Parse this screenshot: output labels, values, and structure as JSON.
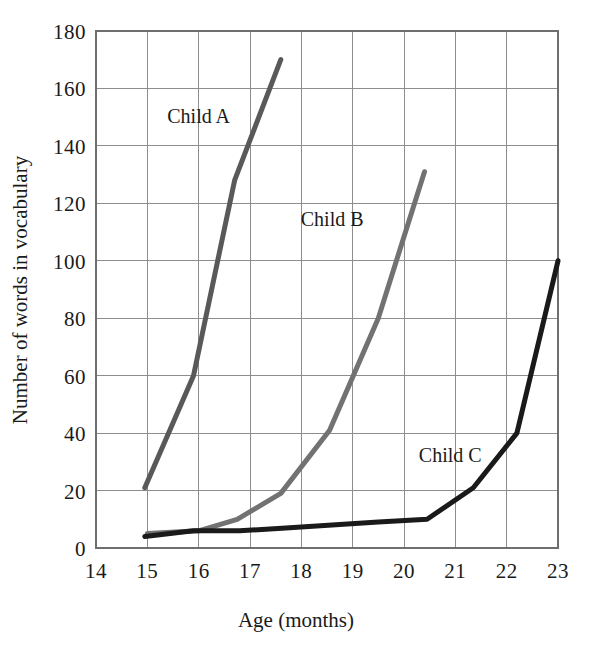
{
  "chart_data": {
    "type": "line",
    "title": "",
    "xlabel": "Age (months)",
    "ylabel": "Number of words in vocabulary",
    "xlim": [
      14,
      23
    ],
    "ylim": [
      0,
      180
    ],
    "x_ticks": [
      14,
      15,
      16,
      17,
      18,
      19,
      20,
      21,
      22,
      23
    ],
    "y_ticks": [
      0,
      20,
      40,
      60,
      80,
      100,
      120,
      140,
      160,
      180
    ],
    "grid": true,
    "legend_position": "inline-annotations",
    "series": [
      {
        "name": "Child A",
        "color": "#595959",
        "label_x": 16.0,
        "label_y": 148,
        "points": [
          {
            "x": 14.95,
            "y": 21
          },
          {
            "x": 15.9,
            "y": 60
          },
          {
            "x": 16.7,
            "y": 128
          },
          {
            "x": 17.6,
            "y": 170
          }
        ]
      },
      {
        "name": "Child B",
        "color": "#727272",
        "label_x": 18.6,
        "label_y": 112,
        "points": [
          {
            "x": 15.0,
            "y": 5
          },
          {
            "x": 16.0,
            "y": 6
          },
          {
            "x": 16.75,
            "y": 10
          },
          {
            "x": 17.6,
            "y": 19
          },
          {
            "x": 18.55,
            "y": 41
          },
          {
            "x": 19.5,
            "y": 80
          },
          {
            "x": 20.4,
            "y": 131
          }
        ]
      },
      {
        "name": "Child C",
        "color": "#1a1a1a",
        "label_x": 20.9,
        "label_y": 30,
        "points": [
          {
            "x": 14.95,
            "y": 4
          },
          {
            "x": 15.9,
            "y": 6
          },
          {
            "x": 16.8,
            "y": 6
          },
          {
            "x": 17.7,
            "y": 7
          },
          {
            "x": 18.6,
            "y": 8
          },
          {
            "x": 19.5,
            "y": 9
          },
          {
            "x": 20.45,
            "y": 10
          },
          {
            "x": 21.35,
            "y": 21
          },
          {
            "x": 22.2,
            "y": 40
          },
          {
            "x": 23.0,
            "y": 100
          }
        ]
      }
    ]
  },
  "axes": {
    "x_tick_labels": [
      "14",
      "15",
      "16",
      "17",
      "18",
      "19",
      "20",
      "21",
      "22",
      "23"
    ],
    "y_tick_labels": [
      "0",
      "20",
      "40",
      "60",
      "80",
      "100",
      "120",
      "140",
      "160",
      "180"
    ],
    "x_axis_title": "Age (months)",
    "y_axis_title": "Number of words in vocabulary"
  },
  "annotations": {
    "child_a": "Child A",
    "child_b": "Child B",
    "child_c": "Child C"
  },
  "colors": {
    "child_a": "#595959",
    "child_b": "#727272",
    "child_c": "#1a1a1a",
    "grid": "#8d8d8d",
    "border": "#6e6e6e",
    "text": "#1a1a1a",
    "background": "#ffffff"
  }
}
